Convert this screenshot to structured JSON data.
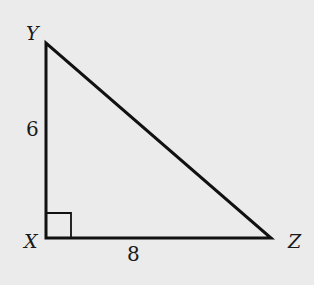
{
  "diagram": {
    "type": "right-triangle",
    "vertices": {
      "Y": {
        "label": "Y",
        "x": 46,
        "y": 43
      },
      "X": {
        "label": "X",
        "x": 46,
        "y": 238
      },
      "Z": {
        "label": "Z",
        "x": 271,
        "y": 238
      }
    },
    "sides": {
      "XY": {
        "label": "6"
      },
      "XZ": {
        "label": "8"
      }
    },
    "right_angle_at": "X",
    "colors": {
      "background": "#ebebeb",
      "stroke": "#111111"
    }
  }
}
